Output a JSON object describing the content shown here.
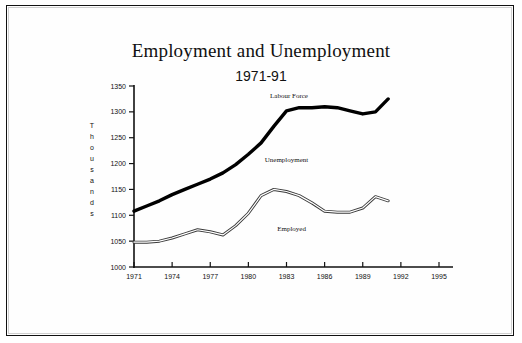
{
  "chart_data": {
    "type": "line",
    "title": "Employment and Unemployment",
    "subtitle": "1971-91",
    "xlabel": "",
    "ylabel": "Thousands",
    "ylabel_letters": [
      "T",
      "h",
      "o",
      "u",
      "s",
      "a",
      "n",
      "d",
      "s"
    ],
    "xlim": [
      1971,
      1995
    ],
    "ylim": [
      1000,
      1350
    ],
    "ytick_step": 50,
    "xtick_step": 3,
    "grid": false,
    "legend_position": "inline-annotations",
    "yticks": [
      "1000",
      "1050",
      "1100",
      "1150",
      "1200",
      "1250",
      "1300",
      "1350"
    ],
    "ytick_values": [
      1000,
      1050,
      1100,
      1150,
      1200,
      1250,
      1300,
      1350
    ],
    "xticks": [
      "1971",
      "1974",
      "1977",
      "1980",
      "1983",
      "1986",
      "1989",
      "1992",
      "1995"
    ],
    "xtick_values": [
      1971,
      1974,
      1977,
      1980,
      1983,
      1986,
      1989,
      1992,
      1995
    ],
    "x": [
      1971,
      1972,
      1973,
      1974,
      1975,
      1976,
      1977,
      1978,
      1979,
      1980,
      1981,
      1982,
      1983,
      1984,
      1985,
      1986,
      1987,
      1988,
      1989,
      1990,
      1991
    ],
    "series": [
      {
        "name": "Labour Force",
        "style": "thick-solid-black",
        "color": "#000000",
        "values": [
          1108,
          1118,
          1128,
          1140,
          1150,
          1160,
          1170,
          1182,
          1198,
          1218,
          1240,
          1272,
          1302,
          1308,
          1308,
          1310,
          1308,
          1302,
          1296,
          1300,
          1325
        ]
      },
      {
        "name": "Employed",
        "style": "thin-double-line",
        "color": "#555555",
        "values": [
          1048,
          1048,
          1050,
          1056,
          1064,
          1072,
          1068,
          1062,
          1080,
          1104,
          1138,
          1150,
          1146,
          1138,
          1124,
          1108,
          1106,
          1106,
          1114,
          1136,
          1128
        ]
      }
    ],
    "annotations": [
      {
        "text": "Labour Force",
        "x": 1983.2,
        "y": 1327,
        "name": "labour-force-label"
      },
      {
        "text": "Unemployment",
        "x": 1983.0,
        "y": 1204,
        "name": "unemployment-label"
      },
      {
        "text": "Employed",
        "x": 1983.4,
        "y": 1070,
        "name": "employed-label"
      }
    ]
  },
  "axes": {
    "y_axis_name": "y-axis",
    "x_axis_name": "x-axis"
  }
}
